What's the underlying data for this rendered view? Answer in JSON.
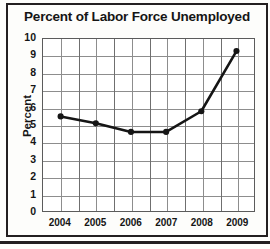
{
  "chart_data": {
    "type": "line",
    "title": "Percent of Labor Force Unemployed",
    "xlabel": "",
    "ylabel": "Percent",
    "categories": [
      "2004",
      "2005",
      "2006",
      "2007",
      "2008",
      "2009"
    ],
    "values": [
      5.5,
      5.1,
      4.6,
      4.6,
      5.8,
      9.3
    ],
    "series": [
      {
        "name": "Percent of Labor Force Unemployed",
        "values": [
          5.5,
          5.1,
          4.6,
          4.6,
          5.8,
          9.3
        ]
      }
    ],
    "ylim": [
      0,
      10
    ],
    "ytick_step": 1,
    "yticks": [
      "10",
      "9",
      "8",
      "7",
      "6",
      "5",
      "4",
      "3",
      "2",
      "1",
      "0"
    ],
    "xticks": [
      "2004",
      "2005",
      "2006",
      "2007",
      "2008",
      "2009"
    ],
    "grid": true,
    "grid_vertical_minor_step": 0.5,
    "legend": "none",
    "marker": "filled-circle",
    "line_color": "#151515",
    "grid_color": "#8d8d8d",
    "plot_background": "#ffffff",
    "frame_color": "#231f20"
  }
}
